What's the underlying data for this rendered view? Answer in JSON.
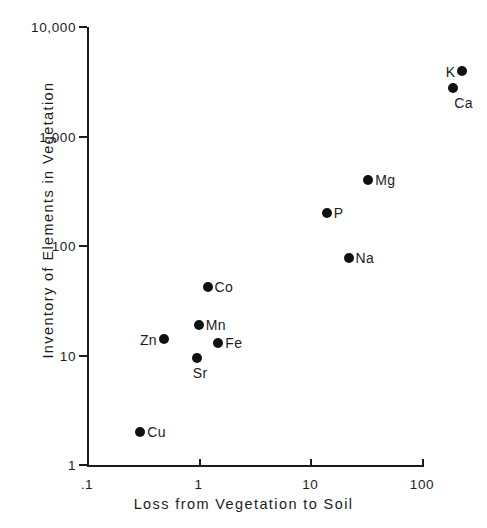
{
  "chart_data": {
    "type": "scatter",
    "title": "",
    "xlabel": "Loss from Vegetation to Soil",
    "ylabel": "Inventory of Elements in Vegetation",
    "xscale": "log",
    "yscale": "log",
    "xlim": [
      0.1,
      100
    ],
    "ylim": [
      1,
      10000
    ],
    "grid": false,
    "legend": false,
    "xticks": [
      {
        "value": 0.1,
        "label": ".1"
      },
      {
        "value": 1,
        "label": "1"
      },
      {
        "value": 10,
        "label": "10"
      },
      {
        "value": 100,
        "label": "100"
      }
    ],
    "yticks": [
      {
        "value": 1,
        "label": "1"
      },
      {
        "value": 10,
        "label": "10"
      },
      {
        "value": 100,
        "label": "100"
      },
      {
        "value": 1000,
        "label": "1,000"
      },
      {
        "value": 10000,
        "label": "10,000"
      }
    ],
    "points": [
      {
        "label": "Cu",
        "x": 0.3,
        "y": 2.0,
        "label_pos": "right"
      },
      {
        "label": "Zn",
        "x": 0.49,
        "y": 14,
        "label_pos": "left"
      },
      {
        "label": "Sr",
        "x": 0.96,
        "y": 9.5,
        "label_pos": "below"
      },
      {
        "label": "Mn",
        "x": 1.0,
        "y": 19,
        "label_pos": "right"
      },
      {
        "label": "Fe",
        "x": 1.5,
        "y": 13,
        "label_pos": "right"
      },
      {
        "label": "Co",
        "x": 1.2,
        "y": 42,
        "label_pos": "right"
      },
      {
        "label": "Na",
        "x": 22,
        "y": 77,
        "label_pos": "right"
      },
      {
        "label": "P",
        "x": 14,
        "y": 200,
        "label_pos": "right"
      },
      {
        "label": "Mg",
        "x": 33,
        "y": 400,
        "label_pos": "right"
      },
      {
        "label": "Ca",
        "x": 190,
        "y": 2800,
        "label_pos": "belowright"
      },
      {
        "label": "K",
        "x": 230,
        "y": 4000,
        "label_pos": "left"
      }
    ],
    "colors": {
      "marker": "#111111",
      "axis": "#1c1c1c",
      "background": "#ffffff"
    }
  }
}
